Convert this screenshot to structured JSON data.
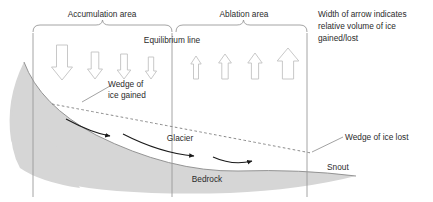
{
  "diagram": {
    "background_color": "#ffffff",
    "ice_fill_color": "#d6d6d6",
    "line_color": "#7a7a7a",
    "text_color": "#2b2b2b",
    "arrow_outline_color": "#bdbdbd",
    "flow_arrow_color": "#1a1a1a",
    "labels": {
      "accumulation_area": "Accumulation area",
      "ablation_area": "Ablation area",
      "equilibrium_line": "Equilibrium line",
      "wedge_of_ice_gained_line1": "Wedge of",
      "wedge_of_ice_gained_line2": "ice gained",
      "wedge_of_ice_lost": "Wedge of ice lost",
      "glacier": "Glacier",
      "bedrock": "Bedrock",
      "snout": "Snout",
      "note_line1": "Width of arrow indicates",
      "note_line2": "relative volume of ice",
      "note_line3": "gained/lost"
    },
    "accumulation_arrows": [
      {
        "name": "accumulation-arrow-1",
        "cx": 62,
        "top": 45,
        "bottom": 80,
        "half_width": 10.5,
        "shaft_half_width": 5.5,
        "head_height": 13
      },
      {
        "name": "accumulation-arrow-2",
        "cx": 95,
        "top": 52,
        "bottom": 79,
        "half_width": 7.5,
        "shaft_half_width": 3.8,
        "head_height": 10
      },
      {
        "name": "accumulation-arrow-3",
        "cx": 124,
        "top": 54,
        "bottom": 79,
        "half_width": 6.8,
        "shaft_half_width": 3.4,
        "head_height": 9
      },
      {
        "name": "accumulation-arrow-4",
        "cx": 151,
        "top": 57,
        "bottom": 79,
        "half_width": 5.6,
        "shaft_half_width": 2.7,
        "head_height": 8
      }
    ],
    "ablation_arrows": [
      {
        "name": "ablation-arrow-1",
        "cx": 196,
        "top": 56,
        "bottom": 79,
        "half_width": 5.2,
        "shaft_half_width": 2.5,
        "head_height": 8
      },
      {
        "name": "ablation-arrow-2",
        "cx": 225,
        "top": 54,
        "bottom": 79,
        "half_width": 6.4,
        "shaft_half_width": 3.2,
        "head_height": 9
      },
      {
        "name": "ablation-arrow-3",
        "cx": 255,
        "top": 53,
        "bottom": 79,
        "half_width": 7.2,
        "shaft_half_width": 3.6,
        "head_height": 10
      },
      {
        "name": "ablation-arrow-4",
        "cx": 288,
        "top": 48,
        "bottom": 79,
        "half_width": 10.8,
        "shaft_half_width": 5.6,
        "head_height": 13
      }
    ],
    "vertical_lines": [
      {
        "name": "boundary-line-left",
        "x": 33,
        "y1": 33,
        "y2": 197
      },
      {
        "name": "equilibrium-line-vertical",
        "x": 172,
        "y1": 33,
        "y2": 197
      },
      {
        "name": "boundary-line-right",
        "x": 307,
        "y1": 33,
        "y2": 197
      }
    ],
    "braces": [
      {
        "name": "brace-accumulation",
        "x1": 33,
        "x2": 172,
        "y": 31
      },
      {
        "name": "brace-ablation",
        "x2": 307,
        "x1": 176,
        "y": 31
      }
    ],
    "flow_arrows": [
      {
        "name": "flow-arrow-1",
        "path": "M 67 120 Q 92 133 112 136"
      },
      {
        "name": "flow-arrow-2",
        "path": "M 123 134 Q 160 153 196 156"
      },
      {
        "name": "flow-arrow-3",
        "path": "M 213 157 Q 232 165 253 161"
      }
    ],
    "leader_lines": [
      {
        "name": "leader-wedge-gained",
        "path": "M 82 102 L 110 86"
      },
      {
        "name": "leader-wedge-lost",
        "path": "M 312 152 L 343 137"
      }
    ],
    "dashed_wedge_line": {
      "name": "dashed-wedge-line",
      "path": "M 52 104 Q 180 128 311 153"
    },
    "ice_surface_path": {
      "name": "glacier-surface-outline",
      "path": "M 24 62 Q 40 105 96 135 Q 170 172 238 171 Q 300 169 356 176"
    },
    "ice_body_path": {
      "name": "glacier-ice-body",
      "path": "M 24 62 Q 40 105 96 135 Q 170 172 238 171 Q 300 169 356 176 Q 300 190 230 193 Q 120 196 60 183 Q 20 172 11 140 Q 5 100 24 62 Z"
    }
  }
}
